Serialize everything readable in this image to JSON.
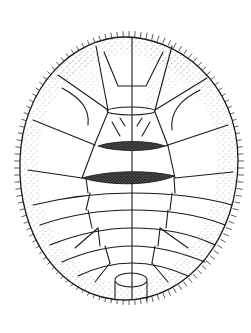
{
  "figure": {
    "colors": {
      "background": "#ffffff",
      "line": "#1a1a1a",
      "stipple": "#444444"
    },
    "segments": {
      "abdominal_bands": 7,
      "dark_transverse_bars": 2
    }
  }
}
